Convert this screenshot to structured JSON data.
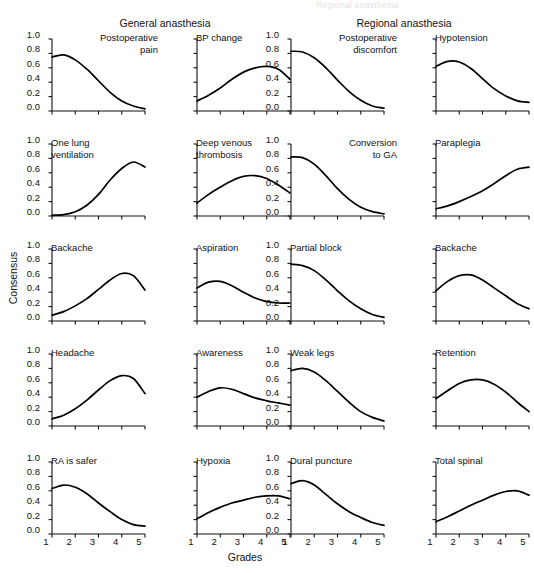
{
  "figure": {
    "group_titles": [
      {
        "label": "General anasthesia"
      },
      {
        "label": "Regional anasthesia"
      }
    ],
    "y_axis_label": "Consensus",
    "x_axis_label": "Grades",
    "y_tick_labels": [
      "1.0",
      "0.8",
      "0.6",
      "0.4",
      "0.2",
      "0.0"
    ],
    "x_tick_labels": [
      "1",
      "2",
      "3",
      "4",
      "5"
    ],
    "scan_artifact_text": "Regional anasthesia"
  },
  "chart_data": {
    "type": "line",
    "xlabel": "Grades",
    "ylabel": "Consensus",
    "xlim": [
      1,
      5
    ],
    "ylim": [
      0,
      1
    ],
    "x": [
      1,
      1.5,
      2,
      2.5,
      3,
      3.5,
      4,
      4.5,
      5
    ],
    "grid": false,
    "legend": null,
    "panel_grid": {
      "rows": 5,
      "cols": 4
    },
    "panels": [
      {
        "title": "Postoperative\npain",
        "group": "General anasthesia",
        "row": 0,
        "col": 0,
        "labeled_y_axis": true,
        "title_align": "right",
        "values": [
          0.75,
          0.78,
          0.71,
          0.58,
          0.42,
          0.26,
          0.14,
          0.07,
          0.03
        ]
      },
      {
        "title": "BP change",
        "group": "General anasthesia",
        "row": 0,
        "col": 1,
        "labeled_y_axis": false,
        "title_align": "left",
        "values": [
          0.14,
          0.22,
          0.32,
          0.44,
          0.54,
          0.6,
          0.62,
          0.58,
          0.44
        ]
      },
      {
        "title": "Postoperative\ndiscomfort",
        "group": "Regional anasthesia",
        "row": 0,
        "col": 2,
        "labeled_y_axis": true,
        "title_align": "right",
        "values": [
          0.83,
          0.82,
          0.74,
          0.6,
          0.43,
          0.27,
          0.15,
          0.07,
          0.04
        ]
      },
      {
        "title": "Hypotension",
        "group": "Regional anasthesia",
        "row": 0,
        "col": 3,
        "labeled_y_axis": false,
        "title_align": "left",
        "values": [
          0.62,
          0.69,
          0.68,
          0.59,
          0.45,
          0.31,
          0.21,
          0.14,
          0.12
        ]
      },
      {
        "title": "One lung\nventilation",
        "group": "General anasthesia",
        "row": 1,
        "col": 0,
        "labeled_y_axis": true,
        "title_align": "left",
        "values": [
          0.01,
          0.02,
          0.06,
          0.15,
          0.3,
          0.5,
          0.66,
          0.75,
          0.68
        ]
      },
      {
        "title": "Deep venous\nthrombosis",
        "group": "General anasthesia",
        "row": 1,
        "col": 1,
        "labeled_y_axis": false,
        "title_align": "left",
        "values": [
          0.18,
          0.3,
          0.4,
          0.49,
          0.55,
          0.56,
          0.52,
          0.43,
          0.32
        ]
      },
      {
        "title": "Conversion\nto GA",
        "group": "Regional anasthesia",
        "row": 1,
        "col": 2,
        "labeled_y_axis": true,
        "title_align": "right",
        "values": [
          0.82,
          0.81,
          0.72,
          0.56,
          0.38,
          0.23,
          0.12,
          0.06,
          0.03
        ]
      },
      {
        "title": "Paraplegia",
        "group": "Regional anasthesia",
        "row": 1,
        "col": 3,
        "labeled_y_axis": false,
        "title_align": "left",
        "values": [
          0.1,
          0.14,
          0.2,
          0.27,
          0.35,
          0.45,
          0.56,
          0.65,
          0.68
        ]
      },
      {
        "title": "Backache",
        "group": "General anasthesia",
        "row": 2,
        "col": 0,
        "labeled_y_axis": true,
        "title_align": "left",
        "values": [
          0.08,
          0.13,
          0.21,
          0.31,
          0.44,
          0.57,
          0.66,
          0.63,
          0.43
        ]
      },
      {
        "title": "Aspiration",
        "group": "General anasthesia",
        "row": 2,
        "col": 1,
        "labeled_y_axis": false,
        "title_align": "left",
        "values": [
          0.46,
          0.54,
          0.55,
          0.49,
          0.4,
          0.32,
          0.27,
          0.25,
          0.25
        ]
      },
      {
        "title": "Partial block",
        "group": "Regional anasthesia",
        "row": 2,
        "col": 2,
        "labeled_y_axis": true,
        "title_align": "left",
        "values": [
          0.79,
          0.77,
          0.7,
          0.57,
          0.42,
          0.28,
          0.17,
          0.09,
          0.05
        ]
      },
      {
        "title": "Backache",
        "group": "Regional anasthesia",
        "row": 2,
        "col": 3,
        "labeled_y_axis": false,
        "title_align": "left",
        "values": [
          0.42,
          0.55,
          0.63,
          0.64,
          0.57,
          0.46,
          0.35,
          0.24,
          0.17
        ]
      },
      {
        "title": "Headache",
        "group": "General anasthesia",
        "row": 3,
        "col": 0,
        "labeled_y_axis": true,
        "title_align": "left",
        "values": [
          0.1,
          0.15,
          0.24,
          0.36,
          0.5,
          0.63,
          0.7,
          0.66,
          0.45
        ]
      },
      {
        "title": "Awareness",
        "group": "General anasthesia",
        "row": 3,
        "col": 1,
        "labeled_y_axis": false,
        "title_align": "left",
        "values": [
          0.4,
          0.48,
          0.53,
          0.51,
          0.45,
          0.39,
          0.35,
          0.32,
          0.29
        ]
      },
      {
        "title": "Weak legs",
        "group": "Regional anasthesia",
        "row": 3,
        "col": 2,
        "labeled_y_axis": true,
        "title_align": "left",
        "values": [
          0.77,
          0.8,
          0.75,
          0.63,
          0.48,
          0.33,
          0.2,
          0.12,
          0.07
        ]
      },
      {
        "title": "Retention",
        "group": "Regional anasthesia",
        "row": 3,
        "col": 3,
        "labeled_y_axis": false,
        "title_align": "left",
        "values": [
          0.38,
          0.49,
          0.59,
          0.64,
          0.64,
          0.58,
          0.47,
          0.33,
          0.2
        ]
      },
      {
        "title": "RA is safer",
        "group": "General anasthesia",
        "row": 4,
        "col": 0,
        "labeled_y_axis": true,
        "title_align": "left",
        "values": [
          0.63,
          0.68,
          0.65,
          0.56,
          0.43,
          0.31,
          0.2,
          0.13,
          0.11
        ]
      },
      {
        "title": "Hypoxia",
        "group": "General anasthesia",
        "row": 4,
        "col": 1,
        "labeled_y_axis": false,
        "title_align": "left",
        "values": [
          0.21,
          0.3,
          0.37,
          0.43,
          0.47,
          0.51,
          0.53,
          0.53,
          0.49
        ]
      },
      {
        "title": "Dural puncture",
        "group": "Regional anasthesia",
        "row": 4,
        "col": 2,
        "labeled_y_axis": true,
        "title_align": "left",
        "values": [
          0.7,
          0.74,
          0.68,
          0.55,
          0.42,
          0.31,
          0.23,
          0.16,
          0.12
        ]
      },
      {
        "title": "Total spinal",
        "group": "Regional anasthesia",
        "row": 4,
        "col": 3,
        "labeled_y_axis": false,
        "title_align": "left",
        "values": [
          0.17,
          0.24,
          0.32,
          0.4,
          0.47,
          0.54,
          0.59,
          0.6,
          0.54
        ]
      }
    ]
  }
}
